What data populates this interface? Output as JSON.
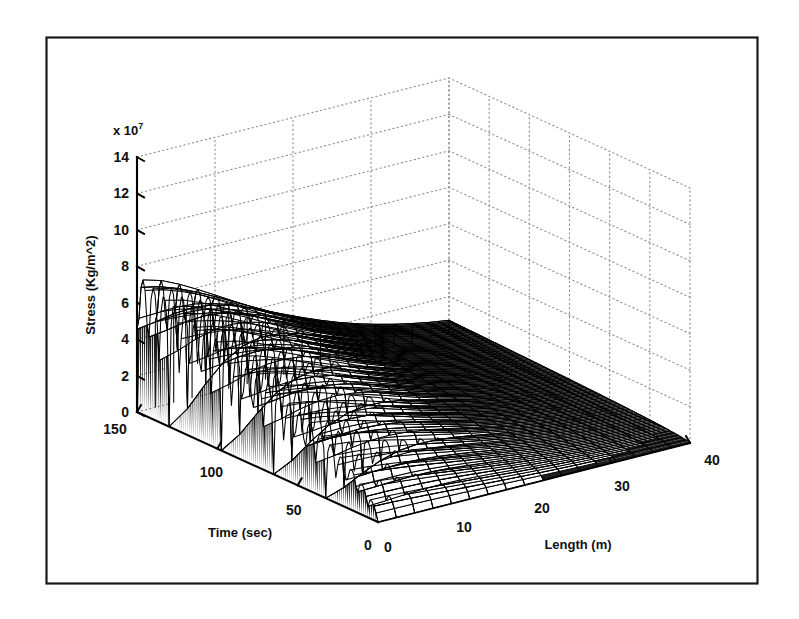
{
  "figure": {
    "background_color": "#ffffff",
    "frame_color": "#1a1a1a",
    "line_color": "#000000",
    "grid_color": "#8a8a8a"
  },
  "axes": {
    "z": {
      "label": "Stress (Kg/m^2)",
      "exponent_prefix": "x 10",
      "exponent_value": "7",
      "ticks": [
        "0",
        "2",
        "4",
        "6",
        "8",
        "10",
        "12",
        "14"
      ],
      "min": 0,
      "max": 14
    },
    "x": {
      "label": "Time (sec)",
      "ticks": [
        "150",
        "100",
        "50",
        "0"
      ],
      "min": 0,
      "max": 150
    },
    "y": {
      "label": "Length (m)",
      "ticks": [
        "0",
        "10",
        "20",
        "30",
        "40"
      ],
      "min": 0,
      "max": 40
    }
  },
  "chart_data": {
    "type": "surface",
    "title": "",
    "xlabel": "Time (sec)",
    "ylabel": "Length (m)",
    "zlabel": "Stress (Kg/m^2)",
    "z_exponent": "x 10^7",
    "xlim": [
      0,
      150
    ],
    "ylim": [
      0,
      40
    ],
    "zlim": [
      0,
      14
    ],
    "xticks": [
      150,
      100,
      50,
      0
    ],
    "yticks": [
      0,
      10,
      20,
      30,
      40
    ],
    "zticks": [
      0,
      2,
      4,
      6,
      8,
      10,
      12,
      14
    ],
    "grid": true,
    "grid_style": "dotted",
    "legend": "none",
    "mesh_color": "#000000",
    "surface": {
      "x_count": 46,
      "y_count": 17,
      "peak_stress": 7.5,
      "peak_at": {
        "time": 150,
        "length": 0
      },
      "oscillation_period_sec": 6.5,
      "oscillation_count": 23,
      "decay_length_m": 22,
      "baseline_stress": 0.0
    },
    "series": [
      {
        "name": "Stress surface",
        "note": "z(t,L) = oscillatory envelope peaking at L=0, decaying to 0 near L=40"
      }
    ]
  }
}
